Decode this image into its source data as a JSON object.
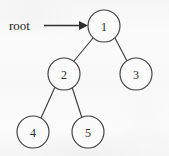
{
  "figure": {
    "kind": "binary-tree-diagram",
    "width": 169,
    "height": 156,
    "background_color": "#fafafa",
    "stroke_color": "#3d3d3d",
    "text_color": "#2b2b2b",
    "node_fill_color": "#fbfbfb"
  },
  "root_pointer": {
    "label": "root",
    "label_x": 9,
    "label_y": 25,
    "arrow_x1": 44,
    "arrow_x2": 87,
    "arrow_y": 25,
    "points_to": "1"
  },
  "nodes": [
    {
      "label": "1",
      "cx": 104,
      "cy": 26,
      "r": 16
    },
    {
      "label": "2",
      "cx": 64,
      "cy": 74,
      "r": 16
    },
    {
      "label": "3",
      "cx": 136,
      "cy": 74,
      "r": 16
    },
    {
      "label": "4",
      "cx": 33,
      "cy": 132,
      "r": 16
    },
    {
      "label": "5",
      "cx": 88,
      "cy": 132,
      "r": 16
    }
  ],
  "edges": [
    {
      "from": "1",
      "to": "2",
      "x1": 93,
      "y1": 38,
      "x2": 74,
      "y2": 61
    },
    {
      "from": "1",
      "to": "3",
      "x1": 115,
      "y1": 38,
      "x2": 127,
      "y2": 61
    },
    {
      "from": "2",
      "to": "4",
      "x1": 55,
      "y1": 87,
      "x2": 41,
      "y2": 118
    },
    {
      "from": "2",
      "to": "5",
      "x1": 72,
      "y1": 87,
      "x2": 82,
      "y2": 118
    }
  ]
}
